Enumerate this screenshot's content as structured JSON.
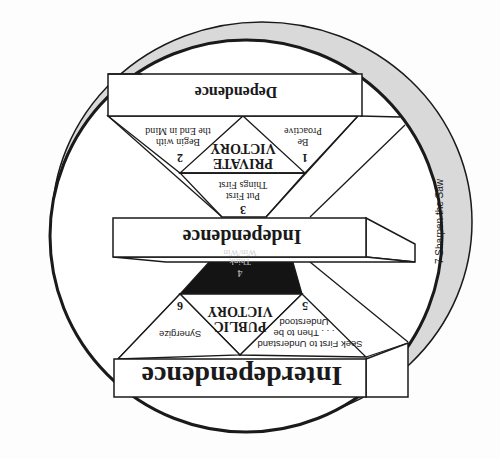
{
  "diagram": {
    "orientation": "rotated-180",
    "colors": {
      "background": "#fdfdfd",
      "stroke": "#1a1a1a",
      "ring": "#d9d9d9",
      "box_fill": "#ffffff",
      "dark_triangle": "#141414"
    },
    "levels": {
      "dependence": "Dependence",
      "independence": "Independence",
      "interdependence": "Interdependence"
    },
    "victories": {
      "private": [
        "PRIVATE",
        "VICTORY"
      ],
      "public": [
        "PUBLIC",
        "VICTORY"
      ]
    },
    "habits": [
      {
        "number": "1",
        "lines": [
          "Be",
          "Proactive"
        ]
      },
      {
        "number": "2",
        "lines": [
          "Begin with",
          "the End in Mind"
        ]
      },
      {
        "number": "3",
        "lines": [
          "Put First",
          "Things First"
        ]
      },
      {
        "number": "4",
        "lines": [
          "Think",
          "Win/Win"
        ]
      },
      {
        "number": "5",
        "lines": [
          "Seek First to Understand",
          ". . . Then to be",
          "Understood"
        ]
      },
      {
        "number": "6",
        "lines": [
          "Synergize"
        ]
      },
      {
        "number": "7",
        "lines": [
          "Sharpen the Saw"
        ]
      }
    ],
    "ring_label": "7  Sharpen the Saw"
  }
}
